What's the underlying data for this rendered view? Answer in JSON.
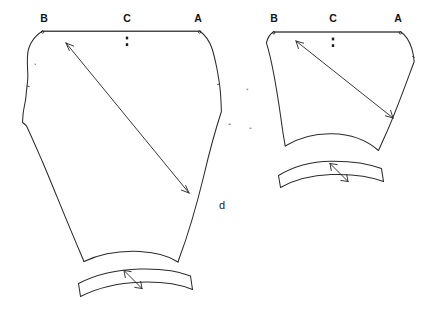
{
  "figure": {
    "caption_label": "d",
    "background_color": "#ffffff",
    "line_color": "#2b2b2b"
  },
  "pieces": [
    {
      "id": "left-piece",
      "name": "large-pattern-piece",
      "top_labels": [
        {
          "text": "B",
          "x": 44,
          "y": 22
        },
        {
          "text": "C",
          "x": 127,
          "y": 22
        },
        {
          "text": "A",
          "x": 198,
          "y": 22
        }
      ],
      "corner_marks": [
        {
          "x": 42.5,
          "y": 31.5
        },
        {
          "x": 199.5,
          "y": 31.5
        }
      ],
      "center_notches": [
        {
          "x": 127,
          "y": 38
        },
        {
          "x": 127,
          "y": 45
        }
      ],
      "grain_arrow": {
        "from_x": 66,
        "from_y": 43,
        "to_x": 189,
        "to_y": 193,
        "double_headed": true
      },
      "cuff": {
        "id": "left-cuff-band",
        "name": "cuff-band",
        "grain_arrow": {
          "from_x": 124,
          "from_y": 270,
          "to_x": 142,
          "to_y": 288,
          "double_headed": true
        }
      }
    },
    {
      "id": "right-piece",
      "name": "small-pattern-piece",
      "top_labels": [
        {
          "text": "B",
          "x": 274,
          "y": 22
        },
        {
          "text": "C",
          "x": 333,
          "y": 22
        },
        {
          "text": "A",
          "x": 398,
          "y": 22
        }
      ],
      "corner_marks": [
        {
          "x": 273.5,
          "y": 32.5
        },
        {
          "x": 400.5,
          "y": 32.5
        }
      ],
      "center_notches": [
        {
          "x": 333,
          "y": 39
        },
        {
          "x": 333,
          "y": 46
        }
      ],
      "grain_arrow": {
        "from_x": 296,
        "from_y": 41,
        "to_x": 393,
        "to_y": 118,
        "double_headed": true
      },
      "cuff": {
        "id": "right-cuff-band",
        "name": "cuff-band",
        "grain_arrow": {
          "from_x": 330,
          "from_y": 163,
          "to_x": 348,
          "to_y": 181,
          "double_headed": true
        }
      }
    }
  ],
  "specks": [
    {
      "x": 35,
      "y": 64
    },
    {
      "x": 229,
      "y": 124
    },
    {
      "x": 250,
      "y": 128
    },
    {
      "x": 247,
      "y": 89
    }
  ]
}
